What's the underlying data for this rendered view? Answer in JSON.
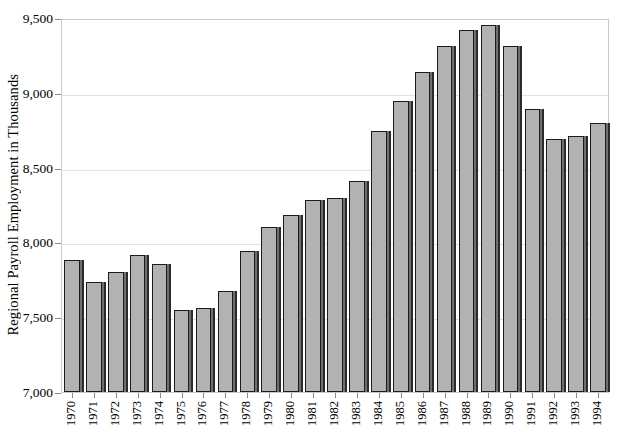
{
  "chart_data": {
    "type": "bar",
    "title": "",
    "subtitle": "",
    "xlabel": "",
    "ylabel": "Regional Payroll Employment in Thousands",
    "ylim": [
      7000,
      9500
    ],
    "ytick_values": [
      7000,
      7500,
      8000,
      8500,
      9000,
      9500
    ],
    "ytick_labels": [
      "7,000",
      "7,500",
      "8,000",
      "8,500",
      "9,000",
      "9,500"
    ],
    "grid": true,
    "legend": null,
    "legend_position": "none",
    "bar_style": {
      "fill": "#b2b2b2",
      "edge": "#1c1c1c",
      "shadow": "#6e6e6e"
    },
    "categories": [
      "1970",
      "1971",
      "1972",
      "1973",
      "1974",
      "1975",
      "1976",
      "1977",
      "1978",
      "1979",
      "1980",
      "1981",
      "1982",
      "1983",
      "1984",
      "1985",
      "1986",
      "1987",
      "1988",
      "1989",
      "1990",
      "1991",
      "1992",
      "1993",
      "1994"
    ],
    "values": [
      7880,
      7735,
      7800,
      7915,
      7855,
      7550,
      7560,
      7675,
      7940,
      8105,
      8180,
      8285,
      8295,
      8410,
      8745,
      8945,
      9140,
      9310,
      9420,
      9455,
      9310,
      8890,
      8690,
      8710,
      8800
    ]
  }
}
